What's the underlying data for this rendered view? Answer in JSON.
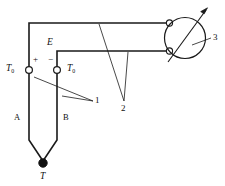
{
  "diagram": {
    "colors": {
      "line": "#1a1a1a",
      "background": "#ffffff",
      "node_fill": "#111111",
      "terminal_fill": "#ffffff"
    },
    "labels": {
      "cold_junction_left": {
        "base": "T",
        "sub": "0"
      },
      "cold_junction_right": {
        "base": "T",
        "sub": "0"
      },
      "emf": "E",
      "polarity_positive": "+",
      "polarity_negative": "−",
      "conductor_a": "A",
      "conductor_b": "B",
      "hot_junction": "T",
      "callout_one": "1",
      "callout_two": "2",
      "callout_three": "3"
    }
  }
}
